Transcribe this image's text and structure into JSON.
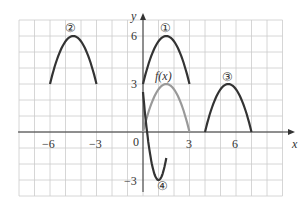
{
  "chart_data": {
    "type": "line",
    "title": "",
    "xlabel": "x",
    "ylabel": "y",
    "xlim": [
      -8,
      9
    ],
    "ylim": [
      -4,
      7
    ],
    "grid": true,
    "x_ticks": [
      "-6",
      "-3",
      "0",
      "3",
      "6"
    ],
    "y_ticks": [
      "6",
      "3",
      "-3"
    ],
    "series": [
      {
        "name": "f(x)",
        "vertex": [
          1.5,
          3
        ],
        "domain": [
          0,
          3
        ],
        "color": "#999999"
      },
      {
        "name": "①",
        "vertex": [
          1.5,
          6
        ],
        "domain": [
          0,
          3
        ],
        "color": "#333333"
      },
      {
        "name": "②",
        "vertex": [
          -4.5,
          6
        ],
        "domain": [
          -6,
          -3
        ],
        "color": "#333333"
      },
      {
        "name": "③",
        "vertex": [
          5.5,
          3
        ],
        "domain": [
          4,
          7
        ],
        "color": "#333333"
      },
      {
        "name": "④",
        "vertex": [
          1,
          -3
        ],
        "domain": [
          0,
          1.5
        ],
        "color": "#333333"
      }
    ]
  },
  "labels": {
    "x": "x",
    "y": "y",
    "origin": "0",
    "fx": "f(x)",
    "c1": "①",
    "c2": "②",
    "c3": "③",
    "c4": "④",
    "xm6": "−6",
    "xm3": "−3",
    "x3": "3",
    "x6": "6",
    "y6": "6",
    "y3": "3",
    "ym3": "−3"
  }
}
